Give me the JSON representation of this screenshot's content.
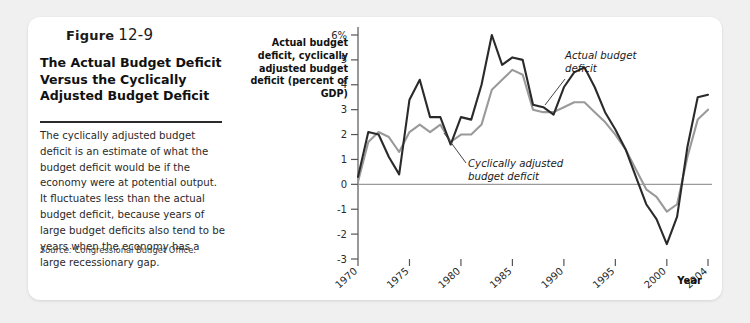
{
  "figure": {
    "badge_word": "Figure",
    "badge_number": "12-9",
    "title": "The Actual Budget Deficit Versus the Cyclically Adjusted Budget Deficit",
    "body": "The cyclically adjusted budget deficit is an estimate of what the budget deficit would be if the economy were at potential output. It fluctuates less than the actual budget deficit, because years of large budget deficits also tend to be years when the economy has a large recessionary gap.",
    "source_lead": "Source:",
    "source_text": "Congressional Budget Office."
  },
  "chart_data": {
    "type": "line",
    "title": "",
    "ylabel": "Actual budget deficit, cyclically adjusted budget deficit (percent of GDP)",
    "xlabel": "Year",
    "ylim": [
      -3,
      6
    ],
    "xlim": [
      1970,
      2004
    ],
    "ytick_labels": [
      "6%",
      "5",
      "4",
      "3",
      "2",
      "1",
      "0",
      "-1",
      "-2",
      "-3"
    ],
    "ytick_values": [
      6,
      5,
      4,
      3,
      2,
      1,
      0,
      -1,
      -2,
      -3
    ],
    "xtick_labels": [
      "1970",
      "1975",
      "1980",
      "1985",
      "1990",
      "1995",
      "2000",
      "2004"
    ],
    "xtick_values": [
      1970,
      1975,
      1980,
      1985,
      1990,
      1995,
      2000,
      2004
    ],
    "grid": false,
    "legend_position": "inline-annotation",
    "annotations": [
      {
        "text": "Actual budget deficit",
        "series": "actual",
        "x": 1996,
        "y": 5.1
      },
      {
        "text": "Cyclically adjusted budget deficit",
        "series": "cyclically_adjusted",
        "x": 1986,
        "y": 0.6
      }
    ],
    "x": [
      1970,
      1971,
      1972,
      1973,
      1974,
      1975,
      1976,
      1977,
      1978,
      1979,
      1980,
      1981,
      1982,
      1983,
      1984,
      1985,
      1986,
      1987,
      1988,
      1989,
      1990,
      1991,
      1992,
      1993,
      1994,
      1995,
      1996,
      1997,
      1998,
      1999,
      2000,
      2001,
      2002,
      2003,
      2004
    ],
    "series": [
      {
        "name": "Actual budget deficit",
        "color": "#2a2a2a",
        "values": [
          0.3,
          2.1,
          2.0,
          1.1,
          0.4,
          3.4,
          4.2,
          2.7,
          2.7,
          1.6,
          2.7,
          2.6,
          4.0,
          6.0,
          4.8,
          5.1,
          5.0,
          3.2,
          3.1,
          2.8,
          3.9,
          4.5,
          4.7,
          3.9,
          2.9,
          2.2,
          1.4,
          0.3,
          -0.8,
          -1.4,
          -2.4,
          -1.3,
          1.5,
          3.5,
          3.6
        ]
      },
      {
        "name": "Cyclically adjusted budget deficit",
        "color": "#9a9a9a",
        "values": [
          0.1,
          1.7,
          2.1,
          1.9,
          1.3,
          2.1,
          2.4,
          2.1,
          2.4,
          1.7,
          2.0,
          2.0,
          2.4,
          3.8,
          4.2,
          4.6,
          4.4,
          3.0,
          2.9,
          2.9,
          3.1,
          3.3,
          3.3,
          2.9,
          2.5,
          2.0,
          1.4,
          0.6,
          -0.2,
          -0.5,
          -1.1,
          -0.8,
          1.1,
          2.6,
          3.0
        ]
      }
    ]
  }
}
